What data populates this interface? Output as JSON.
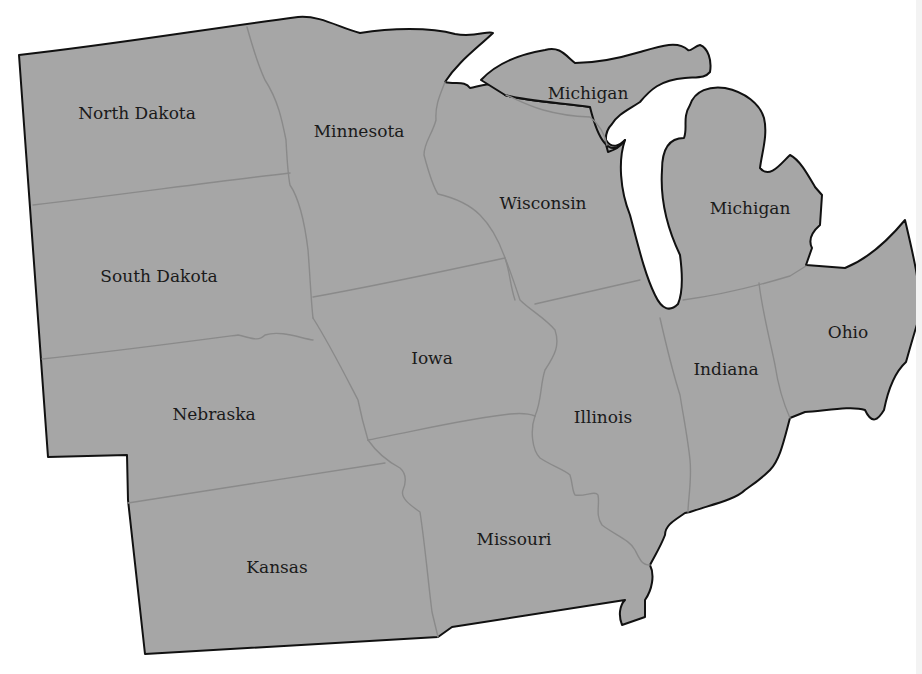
{
  "map": {
    "title": "Midwest United States",
    "colors": {
      "land": "#a6a6a6",
      "coast": "#111111",
      "state_border": "#8a8a8a",
      "water": "#ffffff",
      "label": "#1a1a1a"
    },
    "states": [
      {
        "id": "north-dakota",
        "label": "North Dakota",
        "x": 137,
        "y": 119
      },
      {
        "id": "minnesota",
        "label": "Minnesota",
        "x": 359,
        "y": 137
      },
      {
        "id": "michigan-upper",
        "label": "Michigan",
        "x": 588,
        "y": 99
      },
      {
        "id": "wisconsin",
        "label": "Wisconsin",
        "x": 543,
        "y": 209
      },
      {
        "id": "michigan-lower",
        "label": "Michigan",
        "x": 750,
        "y": 214
      },
      {
        "id": "south-dakota",
        "label": "South Dakota",
        "x": 159,
        "y": 282
      },
      {
        "id": "iowa",
        "label": "Iowa",
        "x": 432,
        "y": 364
      },
      {
        "id": "ohio",
        "label": "Ohio",
        "x": 848,
        "y": 338
      },
      {
        "id": "indiana",
        "label": "Indiana",
        "x": 726,
        "y": 375
      },
      {
        "id": "nebraska",
        "label": "Nebraska",
        "x": 214,
        "y": 420
      },
      {
        "id": "illinois",
        "label": "Illinois",
        "x": 603,
        "y": 423
      },
      {
        "id": "missouri",
        "label": "Missouri",
        "x": 514,
        "y": 545
      },
      {
        "id": "kansas",
        "label": "Kansas",
        "x": 277,
        "y": 573
      }
    ]
  }
}
